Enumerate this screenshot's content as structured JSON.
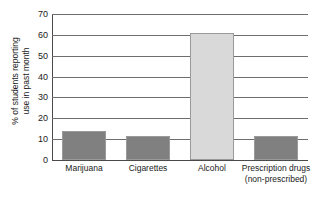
{
  "chart_data": {
    "type": "bar",
    "title": "",
    "xlabel": "",
    "ylabel": "% of students reporting use in past month",
    "ylabel_lines": [
      "% of students reporting",
      "use in past month"
    ],
    "categories": [
      "Marijuana",
      "Cigarettes",
      "Alcohol",
      "Prescription drugs (non-prescribed)"
    ],
    "category_lines": [
      [
        "Marijuana"
      ],
      [
        "Cigarettes"
      ],
      [
        "Alcohol"
      ],
      [
        "Prescription drugs",
        "(non-prescribed)"
      ]
    ],
    "values": [
      14,
      11.5,
      61,
      11.5
    ],
    "ylim": [
      0,
      70
    ],
    "yticks": [
      0,
      10,
      20,
      30,
      40,
      50,
      60,
      70
    ],
    "ytick_labels": [
      "0",
      "10",
      "20",
      "30",
      "40",
      "50",
      "60",
      "70"
    ],
    "grid": true,
    "legend": false,
    "bar_colors": [
      "#808080",
      "#808080",
      "#d9d9d9",
      "#808080"
    ],
    "bar_border_color": "#9a9a9a",
    "axis_color": "#4a4a4a",
    "grid_color": "#6e6e6e",
    "background": "#ffffff"
  }
}
